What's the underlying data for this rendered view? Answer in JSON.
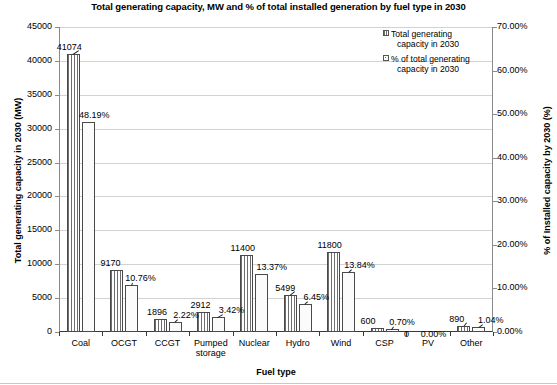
{
  "chart_data": {
    "type": "bar",
    "title": "Total generating capacity, MW and % of total installed generation by fuel type in 2030",
    "xlabel": "Fuel type",
    "ylabel": "Total generating capacity in 2030 (MW)",
    "ylabel_right": "% of Installed capacity by 2030 (%)",
    "categories": [
      "Coal",
      "OCGT",
      "CCGT",
      "Pumped storage",
      "Nuclear",
      "Hydro",
      "Wind",
      "CSP",
      "PV",
      "Other"
    ],
    "series": [
      {
        "name": "Total generating capacity in 2030",
        "axis": "left",
        "values": [
          41074,
          9170,
          1896,
          2912,
          11400,
          5499,
          11800,
          600,
          0,
          890
        ],
        "labels": [
          "41074",
          "9170",
          "1896",
          "2912",
          "11400",
          "5499",
          "11800",
          "600",
          "0",
          "890"
        ],
        "pattern": "vertical-stripes"
      },
      {
        "name": "% of total generating capacity in 2030",
        "axis": "right",
        "values": [
          48.19,
          10.76,
          2.22,
          3.42,
          13.37,
          6.45,
          13.84,
          0.7,
          0.0,
          1.04
        ],
        "labels": [
          "48.19%",
          "10.76%",
          "2.22%",
          "3.42%",
          "13.37%",
          "6.45%",
          "13.84%",
          "0.70%",
          "0.00%",
          "1.04%"
        ],
        "pattern": "dots"
      }
    ],
    "ylim": [
      0,
      45000
    ],
    "ylim_right": [
      0,
      70
    ],
    "yticks": [
      "0",
      "5000",
      "10000",
      "15000",
      "20000",
      "25000",
      "30000",
      "35000",
      "40000",
      "45000"
    ],
    "yticks_right": [
      "0.00%",
      "10.00%",
      "20.00%",
      "30.00%",
      "40.00%",
      "50.00%",
      "60.00%",
      "70.00%"
    ],
    "grid": true,
    "legend_position": "top-right",
    "legend": [
      {
        "line1": "Total generating",
        "line2": "capacity in 2030"
      },
      {
        "line1": "% of total generating",
        "line2": "capacity in 2030"
      }
    ]
  }
}
